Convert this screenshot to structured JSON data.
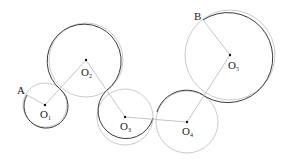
{
  "diagram": {
    "type": "chain-of-circles",
    "colors": {
      "dark_arc": "#3a3a3a",
      "light_arc": "#b8b8b8",
      "segment": "#bdbdbd",
      "point": "#111111",
      "text": "#222222"
    },
    "endpoints": [
      {
        "id": "A",
        "label": "A",
        "x": 27,
        "y": 95
      },
      {
        "id": "B",
        "label": "B",
        "x": 203,
        "y": 20
      }
    ],
    "circles": [
      {
        "id": "O1",
        "label": "O",
        "sub": "1",
        "cx": 45,
        "cy": 105,
        "r": 22
      },
      {
        "id": "O2",
        "label": "O",
        "sub": "2",
        "cx": 86,
        "cy": 60,
        "r": 37
      },
      {
        "id": "O3",
        "label": "O",
        "sub": "3",
        "cx": 125,
        "cy": 117,
        "r": 28
      },
      {
        "id": "O4",
        "label": "O",
        "sub": "4",
        "cx": 187,
        "cy": 122,
        "r": 31
      },
      {
        "id": "O5",
        "label": "O",
        "sub": "5",
        "cx": 230,
        "cy": 55,
        "r": 45
      }
    ]
  }
}
